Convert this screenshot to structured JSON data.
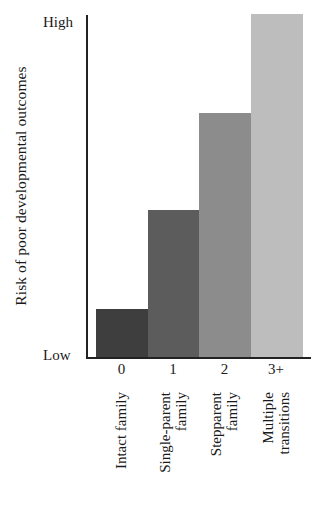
{
  "chart_data": {
    "type": "bar",
    "title": "",
    "xlabel": "",
    "ylabel": "Risk of poor developmental outcomes",
    "y_tick_labels": [
      "Low",
      "High"
    ],
    "ylim": [
      0,
      100
    ],
    "categories": [
      "0",
      "1",
      "2",
      "3+"
    ],
    "category_descriptions": [
      [
        "Intact family"
      ],
      [
        "Single-parent",
        "family"
      ],
      [
        "Stepparent",
        "family"
      ],
      [
        "Multiple",
        "transitions"
      ]
    ],
    "values": [
      14,
      43,
      71,
      100
    ],
    "bar_colors": [
      "#3e3e3e",
      "#5c5c5c",
      "#8c8c8c",
      "#bdbdbd"
    ],
    "grid": false,
    "legend": null
  },
  "axis": {
    "ylabel": "Risk of poor developmental outcomes",
    "high": "High",
    "low": "Low"
  }
}
